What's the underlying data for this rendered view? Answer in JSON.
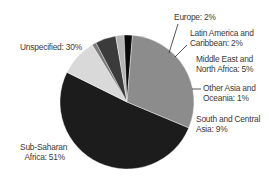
{
  "chart_data": {
    "type": "pie",
    "title": "",
    "center": [
      127,
      102
    ],
    "radius": 67,
    "start_angle_deg": 22.7,
    "direction": "counterclockwise-from-start (screen: decreasing angle)",
    "slices": [
      {
        "label": "Sub-Saharan Africa",
        "value": 51,
        "color": "#1c1c1c"
      },
      {
        "label": "South and Central Asia",
        "value": 9,
        "color": "#d9d9d9"
      },
      {
        "label": "Other Asia and Oceania",
        "value": 1,
        "color": "#7a7a7a"
      },
      {
        "label": "Middle East and North Africa",
        "value": 5,
        "color": "#3b3b3b"
      },
      {
        "label": "Latin America and Caribbean",
        "value": 2,
        "color": "#b5b5b5"
      },
      {
        "label": "Europe",
        "value": 2,
        "color": "#0a0a0a"
      },
      {
        "label": "Unspecified",
        "value": 30,
        "color": "#8c8c8c"
      }
    ],
    "unit": "%"
  },
  "labels": {
    "europe": "Europe: 2%",
    "latin_1": "Latin America and",
    "latin_2": "Caribbean: 2%",
    "mena_1": "Middle East and",
    "mena_2": "North Africa: 5%",
    "oasia_1": "Other Asia and",
    "oasia_2": "Oceania: 1%",
    "sca_1": "South and Central",
    "sca_2": "Asia: 9%",
    "unspecified": "Unspecified: 30%",
    "ssa_1": "Sub-Saharan",
    "ssa_2": "Africa: 51%"
  }
}
